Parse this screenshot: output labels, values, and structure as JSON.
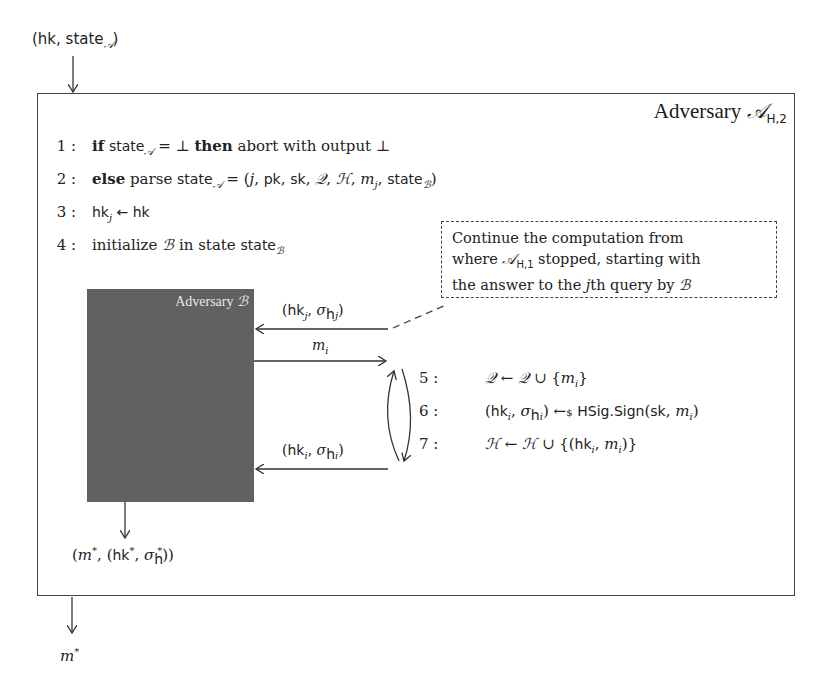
{
  "diagram": {
    "input_label": "(hk, state_A)",
    "output_label": "m*",
    "main_box": {
      "title": "Adversary",
      "title_symbol": "A",
      "title_subscript": "H,2"
    },
    "lines": [
      {
        "num": "1 :",
        "keyword_if": "if",
        "text_a": "state",
        "sub_a": "A",
        "text_b": " = ⊥ ",
        "keyword_then": "then",
        "text_c": " abort with output ⊥"
      },
      {
        "num": "2 :",
        "keyword_else": "else",
        "text_a": " parse ",
        "state": "state",
        "sub_a": "A",
        "text_b": " = (j, pk, sk, Q, H, m",
        "sub_b": "j",
        "text_c": ", state",
        "sub_c": "B",
        "text_d": ")"
      },
      {
        "num": "3 :",
        "text_a": "hk",
        "sub_a": "j",
        "text_b": " ← hk"
      },
      {
        "num": "4 :",
        "text_a": "initialize ",
        "sym": "B",
        "text_b": " in state ",
        "state": "state",
        "sub_b": "B"
      }
    ],
    "note": {
      "line1": "Continue the computation from",
      "line2_a": "where ",
      "line2_sym": "A",
      "line2_sub": "H,1",
      "line2_b": " stopped, starting with",
      "line3_a": "the answer to the ",
      "line3_j": "j",
      "line3_b": "th query by ",
      "line3_sym": "B"
    },
    "inner_box": {
      "title": "Adversary",
      "title_symbol": "B",
      "color": "#616161"
    },
    "messages": {
      "top_left": "(hk",
      "top_sub": "j",
      "top_mid": ", σ",
      "top_sub2": "hj",
      "top_right": ")",
      "query": "m",
      "query_sub": "i",
      "bottom_left": "(hk",
      "bottom_sub": "i",
      "bottom_mid": ", σ",
      "bottom_sub2": "hi",
      "bottom_right": ")"
    },
    "loop_lines": [
      {
        "num": "5 :",
        "text": "Q ← Q ∪ {m",
        "sub": "i",
        "end": "}"
      },
      {
        "num": "6 :",
        "text": "(hk",
        "sub": "i",
        "mid": ", σ",
        "sub2": "hi",
        "end": ") ←$ HSig.Sign(sk, m",
        "sub3": "i",
        "end2": ")"
      },
      {
        "num": "7 :",
        "text": "H ← H ∪ {(hk",
        "sub": "i",
        "mid": ", m",
        "sub2": "i",
        "end": ")}"
      }
    ],
    "b_output": {
      "a": "(m",
      "sup1": "*",
      "b": ", (hk",
      "sup2": "*",
      "c": ", σ",
      "sub": "h",
      "sup3": "*",
      "d": "))"
    },
    "final_output": {
      "m": "m",
      "sup": "*"
    }
  }
}
